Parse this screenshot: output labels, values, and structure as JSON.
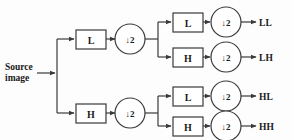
{
  "diagram": {
    "source": {
      "line1": "Source",
      "line2": "image"
    },
    "stage1": [
      {
        "filter": "L",
        "downsample": "↓2"
      },
      {
        "filter": "H",
        "downsample": "↓2"
      }
    ],
    "stage2": [
      {
        "filter": "L",
        "downsample": "↓2",
        "output": "LL"
      },
      {
        "filter": "H",
        "downsample": "↓2",
        "output": "LH"
      },
      {
        "filter": "L",
        "downsample": "↓2",
        "output": "HL"
      },
      {
        "filter": "H",
        "downsample": "↓2",
        "output": "HH"
      }
    ],
    "colors": {
      "background": "#fdfdfd",
      "stroke": "#3a3a3a",
      "text": "#1a1a1a",
      "shape_fill": "#ffffff"
    }
  }
}
